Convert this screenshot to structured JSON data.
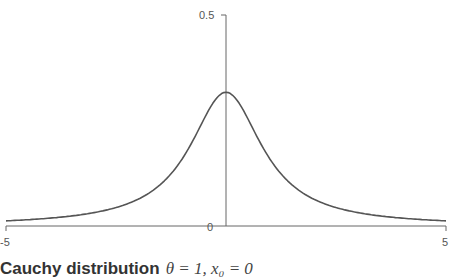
{
  "chart_data": {
    "type": "line",
    "title": "Cauchy distribution",
    "subtitle": "θ = 1, x₀ = 0",
    "xlabel": "",
    "ylabel": "",
    "xlim": [
      -5,
      5
    ],
    "ylim": [
      0,
      0.5
    ],
    "x_ticks": [
      "-5",
      "5"
    ],
    "y_ticks": [
      "0",
      "0.5"
    ],
    "grid": false,
    "legend": null,
    "series": [
      {
        "name": "Cauchy pdf",
        "color": "#555555",
        "x": [
          -5,
          -4.5,
          -4,
          -3.5,
          -3,
          -2.5,
          -2,
          -1.5,
          -1,
          -0.5,
          0,
          0.5,
          1,
          1.5,
          2,
          2.5,
          3,
          3.5,
          4,
          4.5,
          5
        ],
        "y": [
          0.0122,
          0.015,
          0.0187,
          0.0241,
          0.0318,
          0.0439,
          0.0637,
          0.0979,
          0.1592,
          0.2546,
          0.3183,
          0.2546,
          0.1592,
          0.0979,
          0.0637,
          0.0439,
          0.0318,
          0.0241,
          0.0187,
          0.015,
          0.0122
        ]
      }
    ]
  },
  "labels": {
    "x_min": "-5",
    "x_max": "5",
    "y_zero": "0",
    "y_max": "0.5",
    "title_text": "Cauchy distribution",
    "title_math": "θ = 1, x₀ = 0"
  },
  "colors": {
    "axis": "#666666",
    "curve": "#555555",
    "text": "#333333"
  }
}
